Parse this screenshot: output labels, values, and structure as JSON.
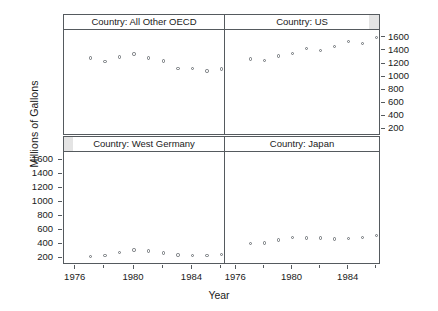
{
  "chart_data": {
    "type": "scatter",
    "title": "",
    "xlabel": "Year",
    "ylabel": "Millions of Gallons",
    "xlim": [
      1975.2,
      1986.3
    ],
    "ylim": [
      100,
      1720
    ],
    "grid": false,
    "legend": null,
    "layout": "2x2 trellis panels, conditioned on Country",
    "x_ticks": [
      1976,
      1980,
      1984
    ],
    "x_tick_labels": [
      "1976",
      "1980",
      "1984"
    ],
    "x_minor_ticks": [
      1978,
      1982,
      1986
    ],
    "y_ticks": [
      200,
      400,
      600,
      800,
      1000,
      1200,
      1400,
      1600
    ],
    "y_tick_labels": [
      "200",
      "400",
      "600",
      "800",
      "1000",
      "1200",
      "1400",
      "1600"
    ],
    "y_axis_side": {
      "top_row": "right",
      "bottom_row": "left"
    },
    "panels": [
      {
        "id": "all-other-oecd",
        "strip_label": "Country: All Other OECD",
        "row": 0,
        "col": 0,
        "x": [
          1977,
          1978,
          1979,
          1980,
          1981,
          1982,
          1983,
          1984,
          1985,
          1986
        ],
        "y": [
          1290,
          1235,
          1310,
          1355,
          1290,
          1245,
          1130,
          1135,
          1095,
          1125
        ]
      },
      {
        "id": "us",
        "strip_label": "Country: US",
        "row": 0,
        "col": 1,
        "x": [
          1977,
          1978,
          1979,
          1980,
          1981,
          1982,
          1983,
          1984,
          1985,
          1986
        ],
        "y": [
          1275,
          1250,
          1320,
          1365,
          1440,
          1405,
          1470,
          1540,
          1515,
          1605
        ]
      },
      {
        "id": "west-germany",
        "strip_label": "Country: West Germany",
        "row": 1,
        "col": 0,
        "x": [
          1977,
          1978,
          1979,
          1980,
          1981,
          1982,
          1983,
          1984,
          1985,
          1986
        ],
        "y": [
          225,
          240,
          275,
          315,
          300,
          270,
          245,
          240,
          240,
          250
        ]
      },
      {
        "id": "japan",
        "strip_label": "Country: Japan",
        "row": 1,
        "col": 1,
        "x": [
          1977,
          1978,
          1979,
          1980,
          1981,
          1982,
          1983,
          1984,
          1985,
          1986
        ],
        "y": [
          410,
          415,
          460,
          490,
          485,
          485,
          475,
          480,
          495,
          525
        ]
      }
    ],
    "colors": {
      "point_stroke": "#6d7276",
      "frame": "#555a5e",
      "text": "#1a1a1a",
      "strip_background": "#ffffff",
      "strip_shade": "#e4e4e4",
      "background": "#ffffff"
    }
  }
}
